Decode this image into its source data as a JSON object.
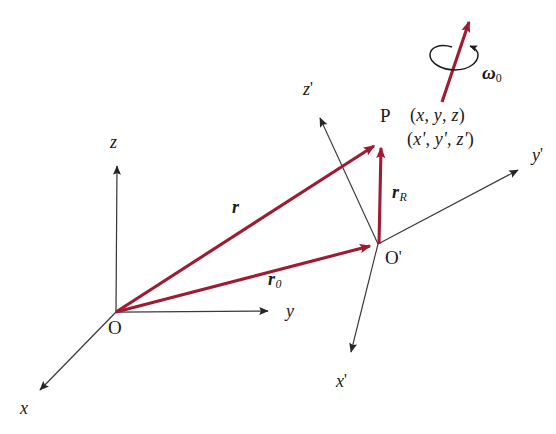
{
  "figure": {
    "background_color": "#ffffff",
    "vector_color": "#9e1b32",
    "axis_color": "#3a3a3a",
    "text_color": "#1a1a1a"
  },
  "points": [
    {
      "id": "O",
      "label": "O",
      "prime": "",
      "x": 116,
      "y": 312,
      "label_x": 108,
      "label_y": 318
    },
    {
      "id": "Op",
      "label": "O",
      "prime": "'",
      "x": 378,
      "y": 244,
      "label_x": 385,
      "label_y": 248
    },
    {
      "id": "P",
      "label": "P",
      "prime": "",
      "x": 381,
      "y": 140,
      "label_x": 380,
      "label_y": 106
    }
  ],
  "axes": {
    "fixed": {
      "origin_label": "O",
      "items": [
        {
          "name": "z",
          "label": "z",
          "prime": "",
          "label_x": 110,
          "label_y": 133
        },
        {
          "name": "y",
          "label": "y",
          "prime": "",
          "label_x": 286,
          "label_y": 302
        },
        {
          "name": "x",
          "label": "x",
          "prime": "",
          "label_x": 20,
          "label_y": 399
        }
      ]
    },
    "rotating": {
      "origin_label": "O'",
      "items": [
        {
          "name": "z-prime",
          "label": "z",
          "prime": "'",
          "label_x": 303,
          "label_y": 80
        },
        {
          "name": "y-prime",
          "label": "y",
          "prime": "'",
          "label_x": 532,
          "label_y": 146
        },
        {
          "name": "x-prime",
          "label": "x",
          "prime": "'",
          "label_x": 336,
          "label_y": 372
        }
      ]
    }
  },
  "vectors": [
    {
      "name": "r",
      "label": "r",
      "subscript": "",
      "from": "O",
      "to": "P",
      "label_x": 232,
      "label_y": 198
    },
    {
      "name": "r0",
      "label": "r",
      "subscript": "0",
      "from": "O",
      "to": "O'",
      "label_x": 268,
      "label_y": 270
    },
    {
      "name": "rR",
      "label": "r",
      "subscript": "R",
      "from": "O'",
      "to": "P",
      "label_x": 392,
      "label_y": 183
    },
    {
      "name": "omega0",
      "label": "ω",
      "subscript": "0",
      "from": "(442,102)",
      "to": "(472,14)",
      "label_x": 482,
      "label_y": 63
    }
  ],
  "coordinates": {
    "unprimed": {
      "open": "(",
      "x": "x",
      "comma1": ", ",
      "y": "y",
      "comma2": ", ",
      "z": "z",
      "close": ")",
      "label_x": 410,
      "label_y": 106
    },
    "primed": {
      "open": "(",
      "x": "x'",
      "comma1": ", ",
      "y": "y'",
      "comma2": ", ",
      "z": "z'",
      "close": ")",
      "label_x": 407,
      "label_y": 130
    }
  },
  "annotations": {
    "rotation_arc": "circular-rotation-arrow-around-omega-axis"
  }
}
